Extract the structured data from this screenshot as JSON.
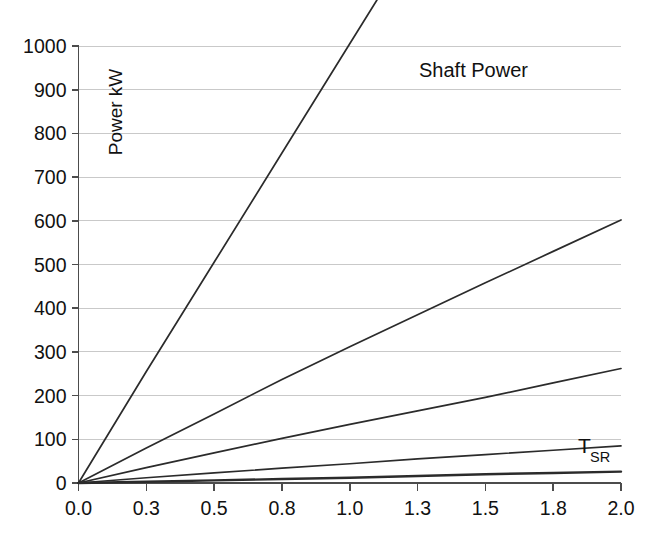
{
  "chart_data": {
    "type": "line",
    "title": "Shaft Power",
    "xlabel": "",
    "ylabel": "Power kW",
    "xlim": [
      0.0,
      2.0
    ],
    "ylim": [
      0,
      1000
    ],
    "grid": true,
    "legend_position": "none",
    "x_tick_labels": [
      "0.0",
      "0.3",
      "0.5",
      "0.8",
      "1.0",
      "1.3",
      "1.5",
      "1.8",
      "2.0"
    ],
    "x_tick_values": [
      0.0,
      0.25,
      0.5,
      0.75,
      1.0,
      1.25,
      1.5,
      1.75,
      2.0
    ],
    "y_tick_labels": [
      "0",
      "100",
      "200",
      "300",
      "400",
      "500",
      "600",
      "700",
      "800",
      "900",
      "1000"
    ],
    "y_tick_values": [
      0,
      100,
      200,
      300,
      400,
      500,
      600,
      700,
      800,
      900,
      1000
    ],
    "x": [
      0.0,
      0.25,
      0.5,
      0.75,
      1.0,
      1.25,
      1.5,
      1.75,
      2.0
    ],
    "series": [
      {
        "name": "series-1",
        "values": [
          0,
          255,
          505,
          755,
          1005,
          null,
          null,
          null,
          null
        ],
        "clipped_above_axis": true
      },
      {
        "name": "series-2",
        "values": [
          0,
          80,
          158,
          237,
          312,
          385,
          458,
          530,
          602
        ]
      },
      {
        "name": "series-3",
        "values": [
          0,
          35,
          69,
          102,
          134,
          165,
          196,
          229,
          262
        ]
      },
      {
        "name": "series-4",
        "values": [
          0,
          12,
          23,
          34,
          44,
          55,
          65,
          75,
          85
        ]
      },
      {
        "name": "series-5",
        "values": [
          0,
          3,
          6,
          9,
          12,
          16,
          20,
          23,
          26
        ]
      }
    ],
    "annotations": [
      {
        "name": "t-sr-label",
        "text": "T",
        "subscript": "SR",
        "x": 1.86,
        "y": 88
      }
    ]
  },
  "axis_colors": {
    "grid": "#c9c9c9",
    "axis": "#4c4c4c",
    "line": "#2b2b2b"
  }
}
